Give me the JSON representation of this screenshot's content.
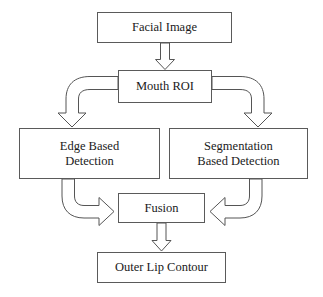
{
  "diagram": {
    "type": "flowchart",
    "background_color": "#ffffff",
    "line_color": "#555555",
    "text_color": "#1a1a1a",
    "nodes": [
      {
        "id": "facial_image",
        "label": "Facial Image"
      },
      {
        "id": "mouth_roi",
        "label": "Mouth ROI"
      },
      {
        "id": "edge_based",
        "label": "Edge Based\nDetection"
      },
      {
        "id": "segmentation_based",
        "label": "Segmentation\nBased Detection"
      },
      {
        "id": "fusion",
        "label": "Fusion"
      },
      {
        "id": "outer_lip_contour",
        "label": "Outer Lip Contour"
      }
    ],
    "edges": [
      {
        "from": "facial_image",
        "to": "mouth_roi",
        "style": "block-arrow-down"
      },
      {
        "from": "mouth_roi",
        "to": "edge_based",
        "style": "curved-block-arrow-left-down"
      },
      {
        "from": "mouth_roi",
        "to": "segmentation_based",
        "style": "curved-block-arrow-right-down"
      },
      {
        "from": "edge_based",
        "to": "fusion",
        "style": "curved-block-arrow-down-right"
      },
      {
        "from": "segmentation_based",
        "to": "fusion",
        "style": "curved-block-arrow-down-left"
      },
      {
        "from": "fusion",
        "to": "outer_lip_contour",
        "style": "block-arrow-down"
      }
    ]
  }
}
